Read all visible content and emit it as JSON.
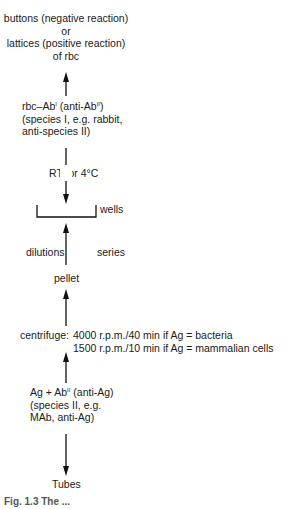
{
  "diagram": {
    "type": "flowchart",
    "nodes": {
      "result": {
        "line1": "buttons (negative reaction)",
        "line2": "or",
        "line3": "lattices (positive reaction)",
        "line4": "of rbc"
      },
      "rbc_ab": {
        "line1_pre": "rbc–Ab",
        "line1_sup1": "I",
        "line1_mid": " (anti-Ab",
        "line1_sup2": "II",
        "line1_post": ")",
        "line2": "(species I, e.g. rabbit,",
        "line3": "anti-species II)"
      },
      "incubation": "RT  or 4°C",
      "wells": "wells",
      "dilutions": "dilutions",
      "series": "series",
      "pellet": "pellet",
      "centrifuge": {
        "label": "centrifuge:",
        "line1": "4000 r.p.m./40 min if Ag = bacteria",
        "line2": "1500 r.p.m./10 min if Ag = mammalian cells"
      },
      "ag_ab": {
        "line1_pre": "Ag + Ab",
        "line1_sup": "II",
        "line1_post": " (anti-Ag)",
        "line2": "(species II, e.g.",
        "line3": "MAb, anti-Ag)"
      },
      "tubes": "Tubes"
    },
    "caption": "Fig. 1.3 The ..."
  }
}
